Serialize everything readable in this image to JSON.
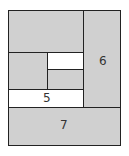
{
  "diagram": {
    "type": "quilt-block-layout",
    "colors": {
      "gray": "#d0d0d0",
      "white": "#ffffff",
      "line": "#222222"
    },
    "pieces": [
      {
        "id": "top",
        "label": ""
      },
      {
        "id": "left-mid",
        "label": ""
      },
      {
        "id": "center-white",
        "label": ""
      },
      {
        "id": "center-gray",
        "label": ""
      },
      {
        "id": "strip-5",
        "label": "5"
      },
      {
        "id": "right-6",
        "label": "6"
      },
      {
        "id": "bottom-7",
        "label": "7"
      }
    ]
  }
}
